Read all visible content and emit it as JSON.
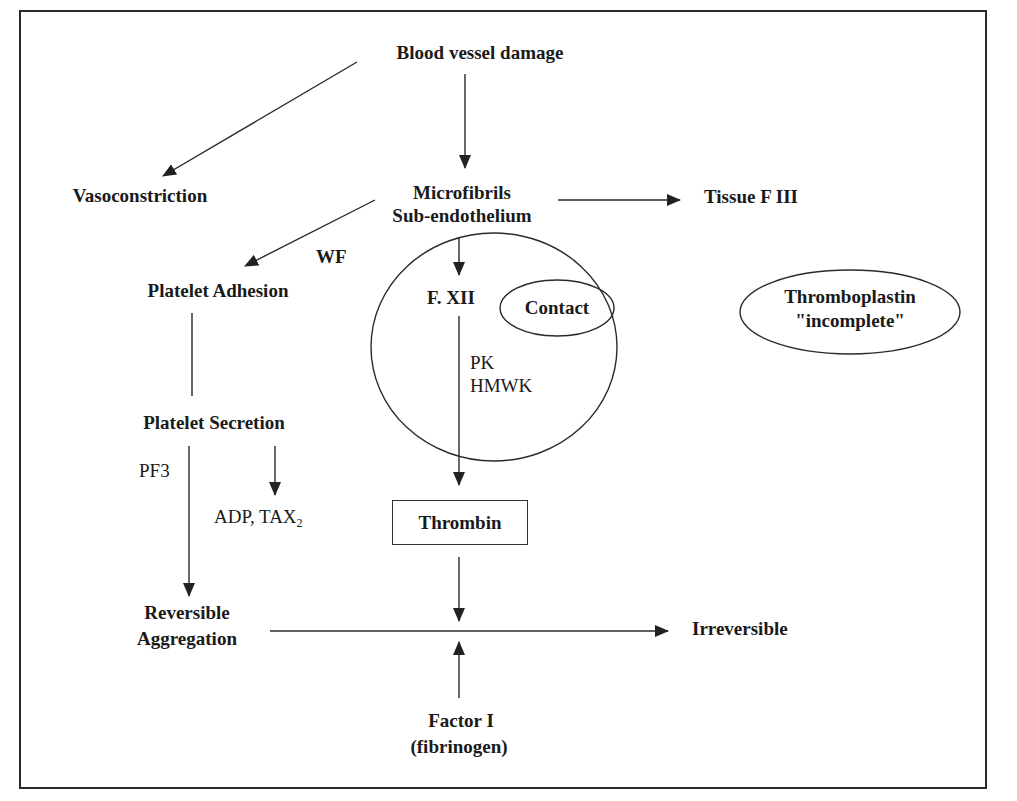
{
  "diagram": {
    "type": "flowchart",
    "nodes": {
      "blood_vessel_damage": "Blood vessel damage",
      "vasoconstriction": "Vasoconstriction",
      "microfibrils": "Microfibrils",
      "sub_endothelium": "Sub-endothelium",
      "tissue_f3": "Tissue F III",
      "platelet_adhesion": "Platelet Adhesion",
      "wf_label": "WF",
      "f12": "F. XII",
      "contact": "Contact",
      "pk": "PK",
      "hmwk": "HMWK",
      "thromboplastin_line1": "Thromboplastin",
      "thromboplastin_line2": "\"incomplete\"",
      "platelet_secretion": "Platelet Secretion",
      "pf3": "PF3",
      "adp_tax": "ADP, TAX",
      "adp_tax_sub": "2",
      "thrombin": "Thrombin",
      "reversible_line1": "Reversible",
      "reversible_line2": "Aggregation",
      "irreversible": "Irreversible",
      "factor1_line1": "Factor I",
      "factor1_line2": "(fibrinogen)"
    },
    "edges": [
      {
        "from": "Blood vessel damage",
        "to": "Vasoconstriction"
      },
      {
        "from": "Blood vessel damage",
        "to": "Microfibrils Sub-endothelium"
      },
      {
        "from": "Microfibrils Sub-endothelium",
        "to": "Tissue F III"
      },
      {
        "from": "Microfibrils Sub-endothelium",
        "to": "Platelet Adhesion",
        "label": "WF"
      },
      {
        "from": "Microfibrils Sub-endothelium",
        "to": "F. XII"
      },
      {
        "from": "F. XII",
        "to": "Thrombin",
        "label": "PK HMWK"
      },
      {
        "from": "Platelet Adhesion",
        "to": "Platelet Secretion"
      },
      {
        "from": "Platelet Secretion",
        "to": "ADP, TAX2"
      },
      {
        "from": "Platelet Secretion",
        "to": "Reversible Aggregation",
        "label": "PF3"
      },
      {
        "from": "Reversible Aggregation",
        "to": "Irreversible"
      },
      {
        "from": "Thrombin",
        "to": "Reversible-Irreversible junction"
      },
      {
        "from": "Factor I (fibrinogen)",
        "to": "Reversible-Irreversible junction"
      }
    ],
    "colors": {
      "line": "#2a2a2a",
      "text": "#1a1a1a",
      "background": "#ffffff"
    }
  }
}
